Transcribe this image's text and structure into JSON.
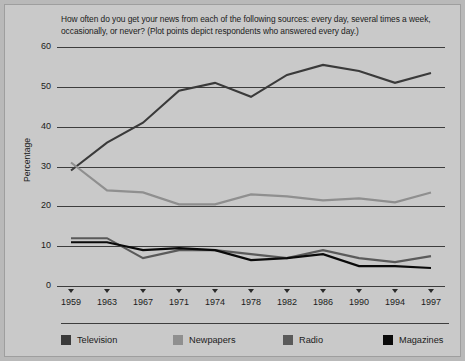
{
  "chart_data": {
    "type": "line",
    "title": "How often do you get your news from each of the following sources: every day, several times a week, occasionally, or never? (Plot points depict respondents who answered every day.)",
    "xlabel": "",
    "ylabel": "Percentage",
    "grid": true,
    "legend_position": "bottom",
    "ylim": [
      0,
      60
    ],
    "yticks": [
      0,
      10,
      20,
      30,
      40,
      50,
      60
    ],
    "categories": [
      "1959",
      "1963",
      "1967",
      "1971",
      "1974",
      "1978",
      "1982",
      "1986",
      "1990",
      "1994",
      "1997"
    ],
    "series": [
      {
        "name": "Television",
        "color": "#3a3a3a",
        "values": [
          29,
          36,
          41,
          49,
          51,
          47.5,
          53,
          55.5,
          54,
          51,
          53.5
        ]
      },
      {
        "name": "Newpapers",
        "color": "#8f8f8f",
        "values": [
          31,
          24,
          23.5,
          20.5,
          20.5,
          23,
          22.5,
          21.5,
          22,
          21,
          23.5
        ]
      },
      {
        "name": "Radio",
        "color": "#5a5a5a",
        "values": [
          12,
          12,
          7,
          9,
          9,
          8,
          7,
          9,
          7,
          6,
          7.5
        ]
      },
      {
        "name": "Magazines",
        "color": "#0a0a0a",
        "values": [
          11,
          11,
          9,
          9.5,
          9,
          6.5,
          7,
          8,
          5,
          5,
          4.5
        ]
      }
    ]
  },
  "figure": {
    "background": "#c9c9c9",
    "axis_color": "#3d3d3d",
    "text_color": "#1b1b1b"
  }
}
